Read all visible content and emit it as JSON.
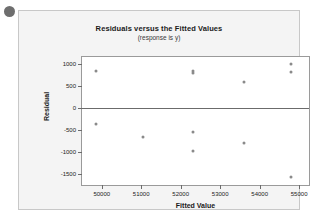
{
  "decor": {
    "bullet_icon": "bullet-dot"
  },
  "chart_data": {
    "type": "scatter",
    "title": "Residuals versus the Fitted Values",
    "subtitle": "(response is y)",
    "xlabel": "Fitted Value",
    "ylabel": "Residual",
    "xlim": [
      49500,
      55250
    ],
    "ylim": [
      -1750,
      1150
    ],
    "xticks": [
      50000,
      51000,
      52000,
      53000,
      54000,
      55000
    ],
    "xticklabels": [
      "50000",
      "51000",
      "52000",
      "53000",
      "54000",
      "55000"
    ],
    "yticks": [
      1000,
      500,
      0,
      -500,
      -1000,
      -1500
    ],
    "yticklabels": [
      "1000",
      "500",
      "0",
      "-500",
      "-1000",
      "-1500"
    ],
    "grid": false,
    "legend": false,
    "reference_line": {
      "axis": "y",
      "value": 0
    },
    "marker": {
      "shape": "circle",
      "color": "#8a8a8a",
      "size": 3
    },
    "points": [
      {
        "x": 49850,
        "y": 840
      },
      {
        "x": 49850,
        "y": -360
      },
      {
        "x": 51050,
        "y": -660
      },
      {
        "x": 52300,
        "y": 830
      },
      {
        "x": 52300,
        "y": 790
      },
      {
        "x": 52300,
        "y": -560
      },
      {
        "x": 52300,
        "y": -980
      },
      {
        "x": 53600,
        "y": 590
      },
      {
        "x": 53600,
        "y": -800
      },
      {
        "x": 54800,
        "y": 1000
      },
      {
        "x": 54800,
        "y": 820
      },
      {
        "x": 54800,
        "y": -1570
      }
    ]
  }
}
